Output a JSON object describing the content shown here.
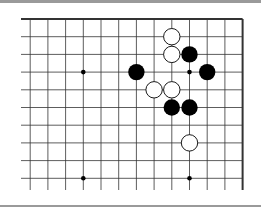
{
  "board": {
    "type": "go-diagram",
    "view": "top-right corner",
    "columns_visible": 13,
    "rows_visible": 10,
    "edges": [
      "top",
      "right"
    ],
    "colors": {
      "black": "#000000",
      "white": "#ffffff",
      "line": "#333333",
      "frame": "#9a9a9a"
    },
    "star_points": [
      [
        3,
        3
      ],
      [
        3,
        9
      ],
      [
        9,
        3
      ],
      [
        9,
        9
      ]
    ],
    "stones": [
      {
        "color": "white",
        "col": 8,
        "row": 1
      },
      {
        "color": "white",
        "col": 8,
        "row": 2
      },
      {
        "color": "black",
        "col": 9,
        "row": 2
      },
      {
        "color": "black",
        "col": 6,
        "row": 3
      },
      {
        "color": "black",
        "col": 10,
        "row": 3
      },
      {
        "color": "white",
        "col": 7,
        "row": 4
      },
      {
        "color": "white",
        "col": 8,
        "row": 4
      },
      {
        "color": "black",
        "col": 8,
        "row": 5
      },
      {
        "color": "black",
        "col": 9,
        "row": 5
      },
      {
        "color": "white",
        "col": 9,
        "row": 7
      }
    ]
  }
}
